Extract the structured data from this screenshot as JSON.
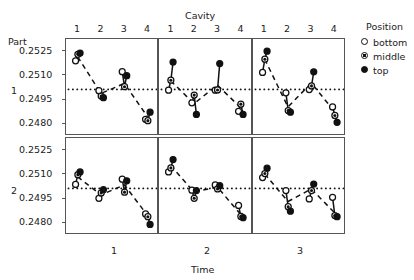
{
  "chart_data": {
    "type": "scatter",
    "title": "",
    "xlabel": "Time",
    "ylabel": "Part",
    "top_axis_label": "Cavity",
    "ylim": [
      0.24725,
      0.25325
    ],
    "yticks": [
      "0.2525",
      "0.2510",
      "0.2495",
      "0.2480"
    ],
    "ytick_values": [
      0.2525,
      0.251,
      0.2495,
      0.248
    ],
    "xticks": [
      "1",
      "2",
      "3",
      "4"
    ],
    "xtick_values": [
      1,
      2,
      3,
      4
    ],
    "row_labels": [
      "1",
      "2"
    ],
    "col_labels": [
      "1",
      "2",
      "3"
    ],
    "grid": false,
    "reference_line": 0.25013,
    "legend": {
      "title": "Position",
      "position": "right",
      "entries": [
        {
          "label": "bottom",
          "marker": "open-circle"
        },
        {
          "label": "middle",
          "marker": "half-filled-circle"
        },
        {
          "label": "top",
          "marker": "filled-circle"
        }
      ]
    },
    "series": [
      {
        "name": "bottom",
        "marker": "open-circle"
      },
      {
        "name": "middle",
        "marker": "half-filled-circle"
      },
      {
        "name": "top",
        "marker": "filled-circle"
      }
    ],
    "panels": [
      {
        "part": "1",
        "time": "1",
        "cavity_means": [
          0.25215,
          0.24988,
          0.2505,
          0.24843
        ],
        "points": {
          "bottom": [
            0.2519,
            0.25005,
            0.25123,
            0.24828
          ],
          "middle": [
            0.2523,
            0.24972,
            0.2503,
            0.2482
          ],
          "top": [
            0.25238,
            0.24962,
            0.25098,
            0.24872
          ]
        }
      },
      {
        "part": "1",
        "time": "2",
        "cavity_means": [
          0.25067,
          0.24925,
          0.2504,
          0.249
        ],
        "points": {
          "bottom": [
            0.25008,
            0.2493,
            0.25008,
            0.24878
          ],
          "middle": [
            0.2507,
            0.24978,
            0.2501,
            0.24922
          ],
          "top": [
            0.25182,
            0.24858,
            0.25173,
            0.24858
          ]
        }
      },
      {
        "part": "1",
        "time": "3",
        "cavity_means": [
          0.252,
          0.24905,
          0.25053,
          0.24875
        ],
        "points": {
          "bottom": [
            0.25118,
            0.24992,
            0.25012,
            0.24905
          ],
          "middle": [
            0.252,
            0.24882,
            0.25035,
            0.24852
          ],
          "top": [
            0.2525,
            0.24872,
            0.25122,
            0.2481
          ]
        }
      },
      {
        "part": "2",
        "time": "1",
        "cavity_means": [
          0.25085,
          0.24973,
          0.25035,
          0.24845
        ],
        "points": {
          "bottom": [
            0.25038,
            0.24952,
            0.2507,
            0.24855
          ],
          "middle": [
            0.25098,
            0.24985,
            0.2499,
            0.24838
          ],
          "top": [
            0.25115,
            0.25005,
            0.2506,
            0.2479
          ]
        }
      },
      {
        "part": "2",
        "time": "2",
        "cavity_means": [
          0.25155,
          0.2499,
          0.25022,
          0.24852
        ],
        "points": {
          "bottom": [
            0.25115,
            0.25002,
            0.25035,
            0.24908
          ],
          "middle": [
            0.2514,
            0.24952,
            0.2501,
            0.2484
          ],
          "top": [
            0.25192,
            0.25,
            0.2503,
            0.24832
          ]
        }
      },
      {
        "part": "2",
        "time": "3",
        "cavity_means": [
          0.25103,
          0.24932,
          0.2501,
          0.24862
        ],
        "points": {
          "bottom": [
            0.2508,
            0.25,
            0.24948,
            0.24958
          ],
          "middle": [
            0.25105,
            0.249,
            0.25,
            0.24845
          ],
          "top": [
            0.25138,
            0.24872,
            0.2504,
            0.24838
          ]
        }
      }
    ]
  },
  "labels": {
    "y_axis_title": "Part",
    "x_axis_title": "Time",
    "top_axis_title": "Cavity",
    "legend_title": "Position",
    "legend_bottom": "bottom",
    "legend_middle": "middle",
    "legend_top": "top",
    "yt0": "0.2525",
    "yt1": "0.2510",
    "yt2": "0.2495",
    "yt3": "0.2480",
    "row1": "1",
    "row2": "2",
    "col1": "1",
    "col2": "2",
    "col3": "3",
    "c1": "1",
    "c2": "2",
    "c3": "3",
    "c4": "4"
  }
}
